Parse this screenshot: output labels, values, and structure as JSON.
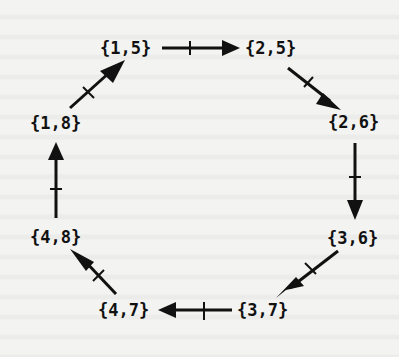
{
  "diagram": {
    "type": "directed-cycle",
    "nodes": [
      {
        "id": "n15",
        "label": "{1,5}",
        "x": 100,
        "y": 38
      },
      {
        "id": "n25",
        "label": "{2,5}",
        "x": 245,
        "y": 38
      },
      {
        "id": "n26",
        "label": "{2,6}",
        "x": 328,
        "y": 112
      },
      {
        "id": "n36",
        "label": "{3,6}",
        "x": 327,
        "y": 228
      },
      {
        "id": "n37",
        "label": "{3,7}",
        "x": 237,
        "y": 300
      },
      {
        "id": "n47",
        "label": "{4,7}",
        "x": 98,
        "y": 300
      },
      {
        "id": "n48",
        "label": "{4,8}",
        "x": 30,
        "y": 227
      },
      {
        "id": "n18",
        "label": "{1,8}",
        "x": 30,
        "y": 113
      }
    ],
    "edges": [
      {
        "from": "{1,5}",
        "to": "{2,5}",
        "tick": true
      },
      {
        "from": "{2,5}",
        "to": "{2,6}",
        "tick": true
      },
      {
        "from": "{2,6}",
        "to": "{3,6}",
        "tick": true
      },
      {
        "from": "{3,6}",
        "to": "{3,7}",
        "tick": true
      },
      {
        "from": "{3,7}",
        "to": "{4,7}",
        "tick": true
      },
      {
        "from": "{4,7}",
        "to": "{4,8}",
        "tick": true
      },
      {
        "from": "{4,8}",
        "to": "{1,8}",
        "tick": true
      },
      {
        "from": "{1,8}",
        "to": "{1,5}",
        "tick": true
      }
    ],
    "colors": {
      "ink": "#111111",
      "paper": "#f3f3f1"
    }
  }
}
